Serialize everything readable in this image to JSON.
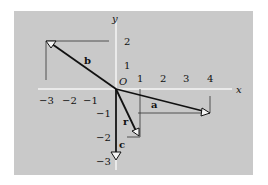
{
  "diagram": {
    "type": "vector-coordinate-plane",
    "colors": {
      "background": "#ffffff",
      "panel": "#c9c9c9",
      "axes": "#f4f4f4",
      "vectors": "#111111",
      "guides": "#333333"
    },
    "axes": {
      "x_label": "x",
      "y_label": "y",
      "origin_label": "O",
      "x_ticks": [
        "−3",
        "−2",
        "−1",
        "1",
        "2",
        "3",
        "4"
      ],
      "y_ticks": [
        "2",
        "1",
        "−1",
        "−2",
        "−3"
      ]
    },
    "vectors": [
      {
        "name": "a",
        "label": "a",
        "from": [
          0,
          0
        ],
        "to": [
          4,
          -1
        ]
      },
      {
        "name": "b",
        "label": "b",
        "from": [
          0,
          0
        ],
        "to": [
          -3,
          2
        ]
      },
      {
        "name": "c",
        "label": "c",
        "from": [
          0,
          0
        ],
        "to": [
          0,
          -3
        ]
      },
      {
        "name": "r",
        "label": "r",
        "from": [
          0,
          0
        ],
        "to": [
          1,
          -2
        ]
      }
    ]
  }
}
